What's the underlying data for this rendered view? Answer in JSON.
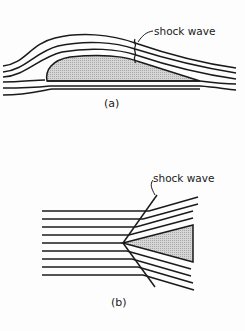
{
  "diagram": {
    "panel_a": {
      "caption": "(a)",
      "shock_label": "shock wave",
      "description": "Streamlines over an airfoil with a normal shock wave on the upper surface"
    },
    "panel_b": {
      "caption": "(b)",
      "shock_label": "shock wave",
      "description": "Parallel streamlines deflected by an oblique shock attached to a wedge"
    },
    "colors": {
      "line": "#1a1a1a",
      "body_fill": "#c8c8c8",
      "background": "#fdfdfd"
    }
  }
}
